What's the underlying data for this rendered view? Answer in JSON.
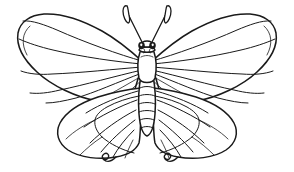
{
  "image": {
    "kind": "line-drawing",
    "subject": "butterfly",
    "style": "coloring-book outline",
    "alt_text": "Black and white outline drawing of a symmetrical butterfly with veined wings",
    "width": 294,
    "height": 172,
    "background_color": "#ffffff",
    "ink_color": "#1a1a1a"
  },
  "figure": {
    "title": "Butterfly",
    "parts": [
      {
        "name": "left-forewing",
        "label": "Left forewing"
      },
      {
        "name": "right-forewing",
        "label": "Right forewing"
      },
      {
        "name": "left-hindwing",
        "label": "Left hindwing"
      },
      {
        "name": "right-hindwing",
        "label": "Right hindwing"
      },
      {
        "name": "thorax",
        "label": "Thorax"
      },
      {
        "name": "abdomen",
        "label": "Abdomen"
      },
      {
        "name": "head",
        "label": "Head"
      },
      {
        "name": "left-antenna",
        "label": "Left antenna"
      },
      {
        "name": "right-antenna",
        "label": "Right antenna"
      },
      {
        "name": "left-tail",
        "label": "Left curled tail"
      },
      {
        "name": "right-tail",
        "label": "Right curled tail"
      }
    ],
    "counts": {
      "abdomen_segments": 7,
      "forewing_veins_per_side": 7,
      "hindwing_veins_per_side": 8,
      "eyes": 2,
      "antennae": 2,
      "curled_tails": 2
    },
    "symmetry_axis_x": 147
  }
}
